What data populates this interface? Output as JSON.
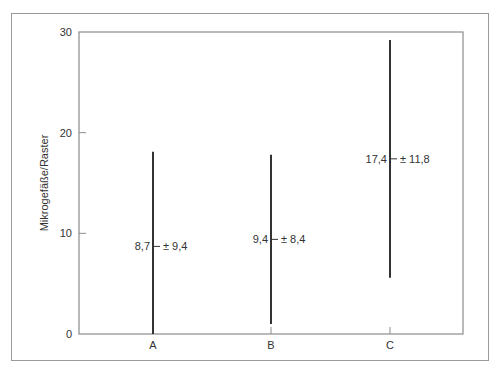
{
  "chart_data": {
    "type": "errorbar",
    "title": "",
    "xlabel": "",
    "ylabel": "Mikrogefäße/Raster",
    "ylim": [
      0,
      30
    ],
    "yticks": [
      0,
      10,
      20,
      30
    ],
    "ytick_labels": [
      "0",
      "10",
      "20",
      "30"
    ],
    "grid": false,
    "categories": [
      "A",
      "B",
      "C"
    ],
    "means": [
      8.7,
      9.4,
      17.4
    ],
    "sd": [
      9.4,
      8.4,
      11.8
    ],
    "mean_labels": [
      "8,7",
      "9,4",
      "17,4"
    ],
    "sd_labels": [
      "± 9,4",
      "± 8,4",
      "± 11,8"
    ],
    "bar_low": [
      0,
      1.0,
      5.6
    ],
    "bar_high": [
      18.1,
      17.8,
      29.2
    ]
  },
  "colors": {
    "axis": "#8c8c8c",
    "bar": "#333333",
    "frame": "#9a9a9a"
  }
}
